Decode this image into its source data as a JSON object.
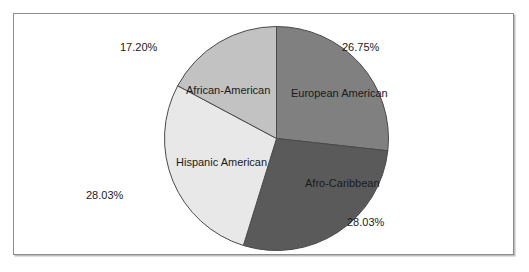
{
  "figure": {
    "background_color": "#ffffff",
    "frame_border_color": "#8d8d8d"
  },
  "chart_data": {
    "type": "pie",
    "title": "",
    "subtitle": "",
    "xlabel": "",
    "ylabel": "",
    "legend_position": "none",
    "grid": false,
    "label_placement": "inside-slice-with-outside-percent",
    "start_angle_deg": 0,
    "direction": "clockwise",
    "units": "percent",
    "categories": [
      "European American",
      "Afro-Caribbean",
      "Hispanic American",
      "African-American"
    ],
    "values": [
      26.75,
      28.03,
      28.03,
      17.2
    ],
    "value_labels": [
      "26.75%",
      "28.03%",
      "28.03%",
      "17.20%"
    ],
    "colors": [
      "#808080",
      "#5a5a5a",
      "#e8e8e8",
      "#c2c2c2"
    ],
    "slice_edge_color": "#4a4a4a",
    "slices": [
      {
        "name": "European American",
        "value": 26.75,
        "label": "European American",
        "percent_label": "26.75%",
        "color": "#808080",
        "start_angle_deg": 0.0,
        "end_angle_deg": 96.3
      },
      {
        "name": "Afro-Caribbean",
        "value": 28.03,
        "label": "Afro-Caribbean",
        "percent_label": "28.03%",
        "color": "#5a5a5a",
        "start_angle_deg": 96.3,
        "end_angle_deg": 197.2
      },
      {
        "name": "Hispanic American",
        "value": 28.03,
        "label": "Hispanic American",
        "percent_label": "28.03%",
        "color": "#e8e8e8",
        "start_angle_deg": 197.2,
        "end_angle_deg": 298.1
      },
      {
        "name": "African-American",
        "value": 17.2,
        "label": "African-American",
        "percent_label": "17.20%",
        "color": "#c2c2c2",
        "start_angle_deg": 298.1,
        "end_angle_deg": 360.0
      }
    ],
    "total": 100.01
  }
}
